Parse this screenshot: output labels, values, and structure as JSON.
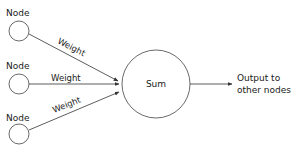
{
  "diagram": {
    "type": "neural-network-neuron",
    "inputs": [
      {
        "label": "Node",
        "edge_label": "Weight"
      },
      {
        "label": "Node",
        "edge_label": "Weight"
      },
      {
        "label": "Node",
        "edge_label": "Weight"
      }
    ],
    "sum_node": {
      "label": "Sum"
    },
    "output": {
      "line1": "Output to",
      "line2": "other nodes"
    },
    "colors": {
      "stroke": "#333333",
      "text": "#1a1a1a",
      "background": "#ffffff"
    }
  }
}
